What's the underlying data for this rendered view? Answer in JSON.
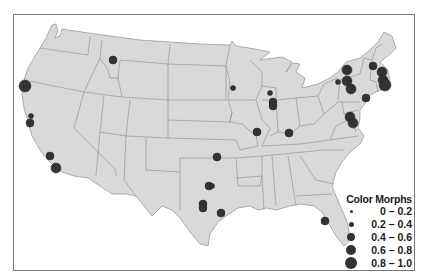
{
  "map": {
    "type": "point-symbol-map",
    "region": "Contiguous United States",
    "land_color": "#d9d9d9",
    "border_color": "#8c8c8c",
    "dot_color": "#333333",
    "frame_color": "#7a7a7a"
  },
  "legend": {
    "title": "Color Morphs",
    "items": [
      {
        "label": "0 – 0.2",
        "size": 3
      },
      {
        "label": "0.2 – 0.4",
        "size": 5
      },
      {
        "label": "0.4 – 0.6",
        "size": 8
      },
      {
        "label": "0.6 – 0.8",
        "size": 10
      },
      {
        "label": "0.8 – 1.0",
        "size": 12
      }
    ]
  },
  "points": [
    {
      "x": 25,
      "y": 86,
      "class": "0.8 – 1.0"
    },
    {
      "x": 31,
      "y": 116,
      "class": "0.2 – 0.4"
    },
    {
      "x": 30,
      "y": 123,
      "class": "0.4 – 0.6"
    },
    {
      "x": 50,
      "y": 156,
      "class": "0.4 – 0.6"
    },
    {
      "x": 56,
      "y": 168,
      "class": "0.6 – 0.8"
    },
    {
      "x": 113,
      "y": 60,
      "class": "0.4 – 0.6"
    },
    {
      "x": 233,
      "y": 88,
      "class": "0.2 – 0.4"
    },
    {
      "x": 270,
      "y": 93,
      "class": "0.2 – 0.4"
    },
    {
      "x": 273,
      "y": 102,
      "class": "0.4 – 0.6"
    },
    {
      "x": 273,
      "y": 106,
      "class": "0.4 – 0.6"
    },
    {
      "x": 257,
      "y": 132,
      "class": "0.4 – 0.6"
    },
    {
      "x": 289,
      "y": 133,
      "class": "0.4 – 0.6"
    },
    {
      "x": 217,
      "y": 157,
      "class": "0.4 – 0.6"
    },
    {
      "x": 209,
      "y": 186,
      "class": "0.4 – 0.6"
    },
    {
      "x": 212,
      "y": 186,
      "class": "0.2 – 0.4"
    },
    {
      "x": 203,
      "y": 204,
      "class": "0.4 – 0.6"
    },
    {
      "x": 203,
      "y": 208,
      "class": "0.4 – 0.6"
    },
    {
      "x": 221,
      "y": 213,
      "class": "0.4 – 0.6"
    },
    {
      "x": 325,
      "y": 221,
      "class": "0.4 – 0.6"
    },
    {
      "x": 347,
      "y": 70,
      "class": "0.6 – 0.8"
    },
    {
      "x": 338,
      "y": 82,
      "class": "0.2 – 0.4"
    },
    {
      "x": 347,
      "y": 81,
      "class": "0.6 – 0.8"
    },
    {
      "x": 351,
      "y": 89,
      "class": "0.6 – 0.8"
    },
    {
      "x": 373,
      "y": 66,
      "class": "0.4 – 0.6"
    },
    {
      "x": 382,
      "y": 72,
      "class": "0.6 – 0.8"
    },
    {
      "x": 383,
      "y": 80,
      "class": "0.6 – 0.8"
    },
    {
      "x": 385,
      "y": 85,
      "class": "0.8 – 1.0"
    },
    {
      "x": 366,
      "y": 98,
      "class": "0.4 – 0.6"
    },
    {
      "x": 350,
      "y": 117,
      "class": "0.6 – 0.8"
    },
    {
      "x": 353,
      "y": 123,
      "class": "0.6 – 0.8"
    }
  ]
}
